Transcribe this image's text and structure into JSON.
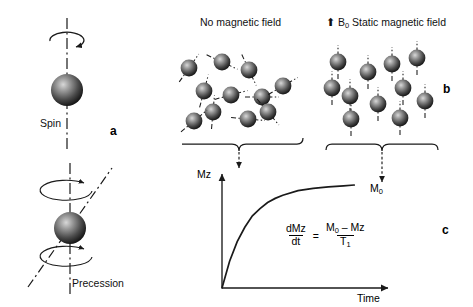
{
  "figure": {
    "domain": "physics-nmr-relaxation-diagram",
    "background": "#ffffff",
    "ink_color": "#1a1a1a",
    "sphere_color_center": "#b4b4b4",
    "sphere_color_edge": "#141414"
  },
  "panels": {
    "a": {
      "letter": "a",
      "spin_label": "Spin",
      "precession_label": "Precession"
    },
    "b": {
      "letter": "b",
      "left_title": "No magnetic field",
      "right_arrow_icon": "up-arrow-icon",
      "right_title_symbol": "B",
      "right_title_subscript": "0",
      "right_title_text": "Static magnetic field"
    },
    "c": {
      "letter": "c",
      "y_axis_label": "Mz",
      "x_axis_label": "Time",
      "curve_asymptote_label_symbol": "M",
      "curve_asymptote_label_subscript": "0",
      "equation": {
        "lhs_numerator": "dMz",
        "lhs_denominator": "dt",
        "operator": "=",
        "rhs_numerator_a": "M",
        "rhs_numerator_a_sub": "0",
        "rhs_numerator_op": "–",
        "rhs_numerator_b": "Mz",
        "rhs_denominator": "T",
        "rhs_denominator_sub": "1"
      }
    }
  },
  "chart_data": {
    "type": "line",
    "title": "",
    "xlabel": "Time",
    "ylabel": "Mz",
    "xlim": [
      0,
      1
    ],
    "ylim": [
      0,
      1
    ],
    "grid": false,
    "legend": null,
    "annotations": [
      {
        "text": "M0",
        "x": 0.92,
        "y": 1.0,
        "note": "equilibrium magnetization asymptote"
      }
    ],
    "series": [
      {
        "name": "Longitudinal recovery Mz(t) = M0 (1 - exp(-t/T1))",
        "x": [
          0.0,
          0.05,
          0.1,
          0.15,
          0.2,
          0.25,
          0.3,
          0.35,
          0.4,
          0.5,
          0.6,
          0.7,
          0.8,
          0.87
        ],
        "y": [
          0.0,
          0.26,
          0.45,
          0.59,
          0.7,
          0.77,
          0.83,
          0.87,
          0.9,
          0.945,
          0.968,
          0.982,
          0.992,
          1.0
        ]
      }
    ]
  },
  "spins_random": [
    {
      "cx": 189,
      "cy": 68,
      "angle": 35
    },
    {
      "cx": 222,
      "cy": 62,
      "angle": 115
    },
    {
      "cx": 249,
      "cy": 70,
      "angle": 155
    },
    {
      "cx": 231,
      "cy": 95,
      "angle": 75
    },
    {
      "cx": 262,
      "cy": 97,
      "angle": 90
    },
    {
      "cx": 204,
      "cy": 91,
      "angle": 15
    },
    {
      "cx": 213,
      "cy": 112,
      "angle": 5
    },
    {
      "cx": 194,
      "cy": 121,
      "angle": 50
    },
    {
      "cx": 248,
      "cy": 119,
      "angle": 95
    },
    {
      "cx": 268,
      "cy": 112,
      "angle": 140
    },
    {
      "cx": 283,
      "cy": 86,
      "angle": 60
    }
  ],
  "spins_aligned": [
    {
      "cx": 338,
      "cy": 62
    },
    {
      "cx": 368,
      "cy": 72
    },
    {
      "cx": 392,
      "cy": 64
    },
    {
      "cx": 417,
      "cy": 58
    },
    {
      "cx": 332,
      "cy": 88
    },
    {
      "cx": 350,
      "cy": 96
    },
    {
      "cx": 403,
      "cy": 88
    },
    {
      "cx": 378,
      "cy": 104
    },
    {
      "cx": 425,
      "cy": 101
    },
    {
      "cx": 351,
      "cy": 119
    },
    {
      "cx": 400,
      "cy": 118
    }
  ]
}
